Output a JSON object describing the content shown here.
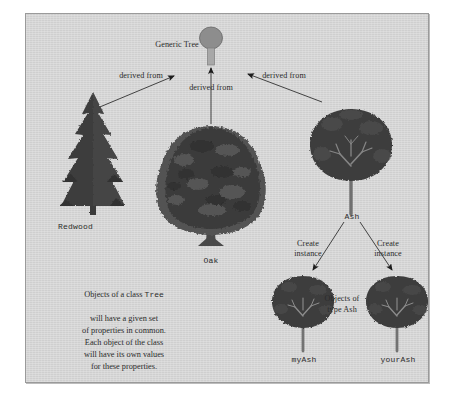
{
  "diagram": {
    "title_node": {
      "label": "Generic Tree",
      "shape": "circle-on-trunk"
    },
    "edges": [
      {
        "name": "redwood-to-generic",
        "label": "derived from"
      },
      {
        "name": "oak-to-generic",
        "label": "derived from"
      },
      {
        "name": "ash-to-generic",
        "label": "derived from"
      },
      {
        "name": "ash-to-myash",
        "label": "Create\ninstance"
      },
      {
        "name": "ash-to-yourash",
        "label": "Create\ninstance"
      }
    ],
    "classes": [
      {
        "name": "redwood",
        "label": "Redwood",
        "kind": "conifer"
      },
      {
        "name": "oak",
        "label": "Oak",
        "kind": "broad-dense"
      },
      {
        "name": "ash",
        "label": "Ash",
        "kind": "branching"
      }
    ],
    "instances": [
      {
        "name": "myash",
        "label": "myAsh",
        "kind": "branching"
      },
      {
        "name": "yourash",
        "label": "yourAsh",
        "kind": "branching"
      }
    ],
    "instances_note": "Objects of\ntype Ash",
    "explanation": {
      "line1_pre": "Objects of a class ",
      "line1_code": "Tree",
      "rest": "will have a given set\nof properties in common.\nEach object of the class\nwill have its own values\nfor these properties."
    },
    "colors": {
      "panel_background": "#d4d4d4",
      "panel_border": "#9a9a9a",
      "ink": "#2b2b2b",
      "foliage_dark": "#3b3b3b",
      "foliage_mid": "#555555",
      "trunk": "#6e6e6e",
      "node_fill": "#8c8c8c"
    }
  }
}
